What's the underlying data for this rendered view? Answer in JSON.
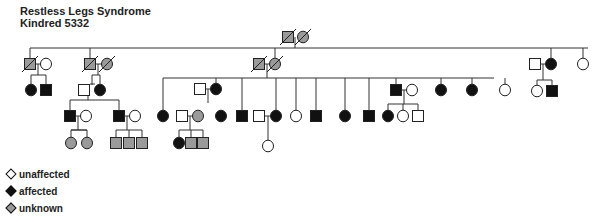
{
  "title": {
    "line1": "Restless Legs Syndrome",
    "line2": "Kindred 5332"
  },
  "colors": {
    "affected": "#111111",
    "unaffected": "#ffffff",
    "unknown": "#9a9a9a",
    "line": "#333333"
  },
  "legend": [
    {
      "status": "unaffected",
      "label": "unaffected"
    },
    {
      "status": "affected",
      "label": "affected"
    },
    {
      "status": "unknown",
      "label": "unknown"
    }
  ],
  "chart_data": {
    "type": "pedigree",
    "title": "Restless Legs Syndrome Kindred 5332",
    "individuals": [
      {
        "id": "I1",
        "sex": "M",
        "status": "unknown",
        "deceased": true,
        "x": 288,
        "y": 37
      },
      {
        "id": "I2",
        "sex": "F",
        "status": "unknown",
        "deceased": true,
        "x": 303,
        "y": 37
      },
      {
        "id": "II1",
        "sex": "M",
        "status": "unknown",
        "deceased": true,
        "x": 30,
        "y": 64
      },
      {
        "id": "II2",
        "sex": "F",
        "status": "unaffected",
        "x": 46,
        "y": 64
      },
      {
        "id": "II3",
        "sex": "M",
        "status": "unknown",
        "deceased": true,
        "x": 90,
        "y": 64
      },
      {
        "id": "II4",
        "sex": "F",
        "status": "unknown",
        "deceased": true,
        "x": 107,
        "y": 64
      },
      {
        "id": "II5",
        "sex": "M",
        "status": "unknown",
        "deceased": true,
        "x": 259,
        "y": 64
      },
      {
        "id": "II6",
        "sex": "F",
        "status": "unknown",
        "deceased": true,
        "x": 275,
        "y": 64
      },
      {
        "id": "II7",
        "sex": "M",
        "status": "unaffected",
        "x": 535,
        "y": 64
      },
      {
        "id": "II8",
        "sex": "F",
        "status": "affected",
        "x": 551,
        "y": 64
      },
      {
        "id": "II9",
        "sex": "F",
        "status": "unaffected",
        "x": 583,
        "y": 64
      },
      {
        "id": "III1",
        "sex": "F",
        "status": "affected",
        "x": 31,
        "y": 90
      },
      {
        "id": "III2",
        "sex": "M",
        "status": "affected",
        "x": 46,
        "y": 90
      },
      {
        "id": "III3",
        "sex": "M",
        "status": "unaffected",
        "x": 84,
        "y": 90
      },
      {
        "id": "III4",
        "sex": "F",
        "status": "affected",
        "x": 100,
        "y": 90
      },
      {
        "id": "III5",
        "sex": "M",
        "status": "unaffected",
        "x": 200,
        "y": 89
      },
      {
        "id": "III6",
        "sex": "F",
        "status": "affected",
        "x": 216,
        "y": 89
      },
      {
        "id": "III7",
        "sex": "M",
        "status": "affected",
        "x": 396,
        "y": 90
      },
      {
        "id": "III8",
        "sex": "F",
        "status": "unaffected",
        "x": 412,
        "y": 90
      },
      {
        "id": "III9",
        "sex": "F",
        "status": "affected",
        "x": 441,
        "y": 90
      },
      {
        "id": "III10",
        "sex": "F",
        "status": "affected",
        "x": 472,
        "y": 90
      },
      {
        "id": "III11",
        "sex": "F",
        "status": "unaffected",
        "x": 505,
        "y": 90
      },
      {
        "id": "III12",
        "sex": "F",
        "status": "unaffected",
        "x": 537,
        "y": 91
      },
      {
        "id": "III13",
        "sex": "M",
        "status": "affected",
        "x": 552,
        "y": 91
      },
      {
        "id": "IV1",
        "sex": "M",
        "status": "affected",
        "x": 70,
        "y": 116
      },
      {
        "id": "IV2",
        "sex": "F",
        "status": "unaffected",
        "x": 86,
        "y": 116
      },
      {
        "id": "IV3",
        "sex": "M",
        "status": "affected",
        "x": 119,
        "y": 116
      },
      {
        "id": "IV4",
        "sex": "F",
        "status": "unaffected",
        "x": 135,
        "y": 116
      },
      {
        "id": "IV5",
        "sex": "F",
        "status": "affected",
        "x": 163,
        "y": 116
      },
      {
        "id": "IV6",
        "sex": "M",
        "status": "unaffected",
        "x": 182,
        "y": 116
      },
      {
        "id": "IV7",
        "sex": "F",
        "status": "unknown",
        "x": 198,
        "y": 116
      },
      {
        "id": "IV8",
        "sex": "F",
        "status": "affected",
        "x": 221,
        "y": 116
      },
      {
        "id": "IV9",
        "sex": "M",
        "status": "affected",
        "x": 242,
        "y": 116
      },
      {
        "id": "IV10",
        "sex": "M",
        "status": "unaffected",
        "x": 259,
        "y": 116
      },
      {
        "id": "IV11",
        "sex": "F",
        "status": "affected",
        "x": 276,
        "y": 116
      },
      {
        "id": "IV12",
        "sex": "F",
        "status": "unaffected",
        "x": 296,
        "y": 116
      },
      {
        "id": "IV13",
        "sex": "M",
        "status": "affected",
        "x": 316,
        "y": 116
      },
      {
        "id": "IV14",
        "sex": "F",
        "status": "affected",
        "x": 345,
        "y": 116
      },
      {
        "id": "IV15",
        "sex": "M",
        "status": "affected",
        "x": 369,
        "y": 116
      },
      {
        "id": "IV16",
        "sex": "F",
        "status": "affected",
        "x": 388,
        "y": 116
      },
      {
        "id": "IV17",
        "sex": "F",
        "status": "unaffected",
        "x": 403,
        "y": 116
      },
      {
        "id": "IV18",
        "sex": "M",
        "status": "unaffected",
        "x": 418,
        "y": 116
      },
      {
        "id": "V1",
        "sex": "F",
        "status": "unknown",
        "x": 71,
        "y": 143
      },
      {
        "id": "V2",
        "sex": "F",
        "status": "unknown",
        "x": 87,
        "y": 143
      },
      {
        "id": "V3",
        "sex": "M",
        "status": "unknown",
        "x": 116,
        "y": 143
      },
      {
        "id": "V4",
        "sex": "M",
        "status": "unknown",
        "x": 129,
        "y": 143
      },
      {
        "id": "V5",
        "sex": "M",
        "status": "unknown",
        "x": 142,
        "y": 143
      },
      {
        "id": "V6",
        "sex": "F",
        "status": "affected",
        "x": 179,
        "y": 143
      },
      {
        "id": "V7",
        "sex": "M",
        "status": "unknown",
        "x": 191,
        "y": 143
      },
      {
        "id": "V8",
        "sex": "M",
        "status": "unknown",
        "x": 203,
        "y": 143
      },
      {
        "id": "V9",
        "sex": "F",
        "status": "unaffected",
        "x": 268,
        "y": 146
      }
    ],
    "lines": [
      [
        295,
        37,
        295,
        48
      ],
      [
        30,
        48,
        588,
        48
      ],
      [
        30,
        48,
        30,
        58
      ],
      [
        90,
        48,
        90,
        58
      ],
      [
        275,
        48,
        275,
        58
      ],
      [
        551,
        48,
        551,
        58
      ],
      [
        583,
        48,
        583,
        58
      ],
      [
        36,
        64,
        41,
        64
      ],
      [
        96,
        64,
        102,
        64
      ],
      [
        265,
        64,
        270,
        64
      ],
      [
        541,
        64,
        546,
        64
      ],
      [
        38,
        64,
        38,
        75
      ],
      [
        31,
        75,
        46,
        75
      ],
      [
        31,
        75,
        31,
        85
      ],
      [
        46,
        75,
        46,
        85
      ],
      [
        98,
        64,
        98,
        75
      ],
      [
        92,
        75,
        92,
        85
      ],
      [
        92,
        75,
        100,
        75
      ],
      [
        90,
        84,
        95,
        84
      ],
      [
        100,
        75,
        100,
        85
      ],
      [
        267,
        64,
        267,
        78
      ],
      [
        163,
        78,
        494,
        78
      ],
      [
        163,
        78,
        163,
        111
      ],
      [
        216,
        78,
        216,
        84
      ],
      [
        242,
        78,
        242,
        111
      ],
      [
        276,
        78,
        276,
        111
      ],
      [
        296,
        78,
        296,
        111
      ],
      [
        316,
        78,
        316,
        111
      ],
      [
        345,
        78,
        345,
        111
      ],
      [
        369,
        78,
        369,
        111
      ],
      [
        396,
        78,
        396,
        85
      ],
      [
        441,
        78,
        441,
        85
      ],
      [
        472,
        78,
        472,
        85
      ],
      [
        505,
        78,
        505,
        85
      ],
      [
        206,
        89,
        211,
        89
      ],
      [
        208,
        89,
        208,
        103
      ],
      [
        543,
        64,
        543,
        80
      ],
      [
        537,
        80,
        552,
        80
      ],
      [
        537,
        80,
        537,
        86
      ],
      [
        552,
        80,
        552,
        86
      ],
      [
        88,
        90,
        88,
        100
      ],
      [
        70,
        100,
        119,
        100
      ],
      [
        70,
        100,
        70,
        111
      ],
      [
        119,
        100,
        119,
        111
      ],
      [
        402,
        90,
        407,
        90
      ],
      [
        404,
        90,
        404,
        104
      ],
      [
        388,
        104,
        418,
        104
      ],
      [
        388,
        104,
        388,
        111
      ],
      [
        403,
        104,
        403,
        111
      ],
      [
        418,
        104,
        418,
        111
      ],
      [
        75,
        116,
        81,
        116
      ],
      [
        78,
        116,
        78,
        130
      ],
      [
        71,
        130,
        87,
        130
      ],
      [
        71,
        130,
        87,
        130
      ],
      [
        71,
        130,
        71,
        138
      ],
      [
        87,
        130,
        87,
        138
      ],
      [
        124,
        116,
        130,
        116
      ],
      [
        127,
        116,
        127,
        130
      ],
      [
        116,
        130,
        142,
        130
      ],
      [
        116,
        130,
        116,
        138
      ],
      [
        129,
        130,
        129,
        138
      ],
      [
        142,
        130,
        142,
        138
      ],
      [
        187,
        116,
        193,
        116
      ],
      [
        190,
        116,
        190,
        130
      ],
      [
        179,
        130,
        203,
        130
      ],
      [
        179,
        130,
        179,
        138
      ],
      [
        191,
        130,
        191,
        138
      ],
      [
        203,
        130,
        203,
        138
      ],
      [
        264,
        116,
        271,
        116
      ],
      [
        268,
        116,
        268,
        141
      ]
    ]
  }
}
